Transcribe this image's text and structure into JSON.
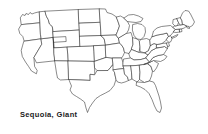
{
  "figure": {
    "caption": "Sequoia, Giant",
    "background_color": "#ffffff",
    "outline_color": "#2b2b2b",
    "fill_color": "#ffffff"
  },
  "map": {
    "title": "United States state outline map",
    "region_label": "Contiguous United States",
    "states": [
      "Washington",
      "Oregon",
      "California",
      "Nevada",
      "Idaho",
      "Montana",
      "Wyoming",
      "Utah",
      "Arizona",
      "Colorado",
      "New Mexico",
      "North Dakota",
      "South Dakota",
      "Nebraska",
      "Kansas",
      "Oklahoma",
      "Texas",
      "Minnesota",
      "Iowa",
      "Missouri",
      "Arkansas",
      "Louisiana",
      "Wisconsin",
      "Illinois",
      "Michigan",
      "Indiana",
      "Ohio",
      "Kentucky",
      "Tennessee",
      "Mississippi",
      "Alabama",
      "Georgia",
      "Florida",
      "South Carolina",
      "North Carolina",
      "Virginia",
      "West Virginia",
      "Maryland",
      "Delaware",
      "Pennsylvania",
      "New Jersey",
      "New York",
      "Connecticut",
      "Rhode Island",
      "Massachusetts",
      "Vermont",
      "New Hampshire",
      "Maine"
    ]
  }
}
